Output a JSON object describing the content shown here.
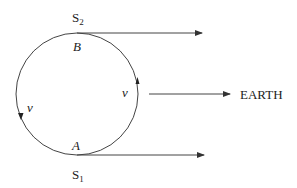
{
  "diagram": {
    "labels": {
      "s2": "S",
      "s2_sub": "2",
      "s1": "S",
      "s1_sub": "1",
      "b": "B",
      "a": "A",
      "v_left": "v",
      "v_right": "v",
      "earth": "EARTH"
    },
    "colors": {
      "stroke": "#333333",
      "text": "#222222"
    }
  }
}
